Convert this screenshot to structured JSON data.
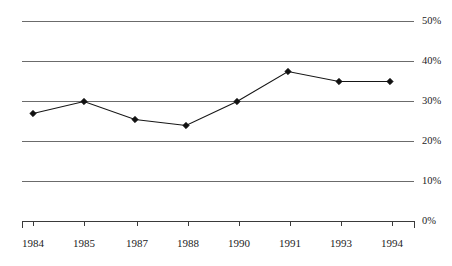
{
  "chart_data": {
    "type": "line",
    "title": "",
    "subtitle": "",
    "xlabel": "",
    "ylabel": "",
    "categories": [
      "1984",
      "1985",
      "1987",
      "1988",
      "1990",
      "1991",
      "1993",
      "1994"
    ],
    "values": [
      27,
      30,
      25.5,
      24,
      30,
      37.5,
      35,
      35
    ],
    "series": [
      {
        "name": "series-1",
        "values": [
          27,
          30,
          25.5,
          24,
          30,
          37.5,
          35,
          35
        ],
        "marker": "diamond",
        "line_color": "#161616",
        "marker_color": "#111111"
      }
    ],
    "ylim": [
      0,
      50
    ],
    "ytick_values": [
      0,
      10,
      20,
      30,
      40,
      50
    ],
    "ytick_labels": [
      "0%",
      "10%",
      "20%",
      "30%",
      "40%",
      "50%"
    ],
    "xtick_labels": [
      "1984",
      "1985",
      "1987",
      "1988",
      "1990",
      "1991",
      "1993",
      "1994"
    ],
    "grid": true,
    "grid_axis": "y",
    "grid_color": "#6b6b6b",
    "legend": false,
    "legend_position": "none",
    "axis_color": "#3a3a3a",
    "background_color": "#ffffff",
    "annotations": []
  },
  "axes": {
    "y_labels": [
      {
        "text": "50%",
        "value": 50
      },
      {
        "text": "40%",
        "value": 40
      },
      {
        "text": "30%",
        "value": 30
      },
      {
        "text": "20%",
        "value": 20
      },
      {
        "text": "10%",
        "value": 10
      },
      {
        "text": "0%",
        "value": 0
      }
    ],
    "x_labels": [
      {
        "text": "1984"
      },
      {
        "text": "1985"
      },
      {
        "text": "1987"
      },
      {
        "text": "1988"
      },
      {
        "text": "1990"
      },
      {
        "text": "1991"
      },
      {
        "text": "1993"
      },
      {
        "text": "1994"
      }
    ]
  }
}
